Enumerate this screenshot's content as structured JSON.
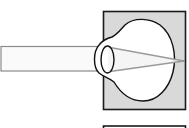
{
  "diagram": {
    "title": "",
    "colors": {
      "background": "#ffffff",
      "panel_fill": "#d9d9d9",
      "panel_stroke": "#1a1a1a",
      "eye_fill": "#ffffff",
      "eye_stroke": "#111111",
      "beam_fill": "#fafafa",
      "beam_stroke": "#8a8a8a",
      "ray_stroke": "#9a9a9a"
    },
    "elements": [
      {
        "id": "light-beam",
        "label": ""
      },
      {
        "id": "eye-panel",
        "label": ""
      },
      {
        "id": "eyeball",
        "label": ""
      },
      {
        "id": "lens",
        "label": ""
      },
      {
        "id": "converging-rays",
        "label": ""
      },
      {
        "id": "focal-point",
        "label": ""
      },
      {
        "id": "lower-panel",
        "label": ""
      }
    ]
  }
}
